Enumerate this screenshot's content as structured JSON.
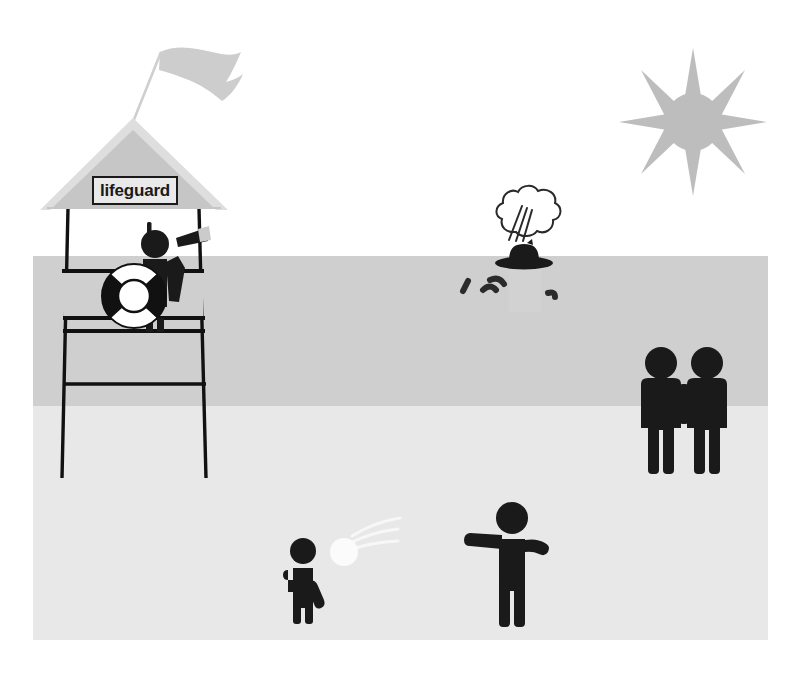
{
  "scene": {
    "title": "Beach lifeguard scene",
    "frame": {
      "x": 33,
      "y": 22,
      "width": 735,
      "height": 618
    }
  },
  "colors": {
    "sky": "#ffffff",
    "sea": "#cfcfcf",
    "sand": "#e8e8e8",
    "figure": "#1a1a1a",
    "sun": "#bdbdbd",
    "flag": "#cdcdcd",
    "roof": "#c6c6c6",
    "roof_edge": "#d8d8d8",
    "ball": "#fbfbfb",
    "block": "#d2d2d2",
    "outline": "#111111",
    "sign_fill": "#e9e9e9"
  },
  "bands": [
    {
      "name": "sky",
      "label": "sky",
      "y": 22,
      "height": 234,
      "color": "#ffffff"
    },
    {
      "name": "sea",
      "label": "sea",
      "y": 256,
      "height": 150,
      "color": "#cfcfcf"
    },
    {
      "name": "sand",
      "label": "sand",
      "y": 406,
      "height": 234,
      "color": "#e8e8e8"
    }
  ],
  "lifeguard_tower": {
    "name": "lifeguard-tower",
    "sign_label": "lifeguard",
    "sign": {
      "x": 93,
      "y": 177,
      "width": 82,
      "height": 26
    },
    "roof": {
      "apex_x": 133,
      "apex_y": 120,
      "left_x": 44,
      "right_x": 222,
      "base_y": 210
    },
    "legs": [
      {
        "name": "left-leg",
        "x": 67,
        "top": 206,
        "bottom": 478
      },
      {
        "name": "right-leg",
        "x": 200,
        "top": 206,
        "bottom": 478
      }
    ],
    "rails": [
      {
        "name": "deck-rail-top",
        "y": 270,
        "x1": 62,
        "x2": 205
      },
      {
        "name": "deck-rail-mid",
        "y": 318,
        "x1": 62,
        "x2": 205
      },
      {
        "name": "deck-rail-low",
        "y": 330,
        "x1": 62,
        "x2": 205
      },
      {
        "name": "deck-rail-bottom",
        "y": 383,
        "x1": 62,
        "x2": 205
      }
    ],
    "flag": {
      "pole_base_x": 133,
      "pole_base_y": 120,
      "pole_tip_x": 160,
      "pole_tip_y": 50
    },
    "life_ring": {
      "cx": 134,
      "cy": 295,
      "r_outer": 32,
      "r_inner": 16
    },
    "guard": {
      "name": "lifeguard-figure",
      "alert_mark": "!",
      "holding": "telescope",
      "head": {
        "cx": 152,
        "cy": 238,
        "r": 14
      }
    }
  },
  "sun": {
    "name": "sun",
    "cx": 693,
    "cy": 122,
    "core_r": 27,
    "ray_count": 8,
    "ray_length": 48,
    "color": "#bdbdbd"
  },
  "swimmer": {
    "name": "splashing-swimmer",
    "hat": true,
    "spray_label": "water spray",
    "block": {
      "x": 508,
      "y": 268,
      "width": 32,
      "height": 42
    },
    "hat_cx": 524,
    "hat_cy": 255,
    "waves": [
      {
        "x": 466,
        "y": 283
      },
      {
        "x": 486,
        "y": 288
      },
      {
        "x": 490,
        "y": 278
      },
      {
        "x": 549,
        "y": 291
      }
    ]
  },
  "couple": {
    "name": "couple-holding-hands",
    "count": 2,
    "figures": [
      {
        "name": "couple-figure-left",
        "cx": 660,
        "head_cy": 363,
        "head_r": 15
      },
      {
        "name": "couple-figure-right",
        "cx": 706,
        "head_cy": 363,
        "head_r": 15
      }
    ]
  },
  "ball_players": {
    "name": "ball-players",
    "catcher": {
      "name": "catcher-figure",
      "cx": 303,
      "head_cy": 551,
      "head_r": 13
    },
    "thrower": {
      "name": "thrower-figure",
      "cx": 511,
      "head_cy": 518,
      "head_r": 16
    },
    "ball": {
      "name": "beach-ball",
      "cx": 344,
      "cy": 551,
      "r": 14,
      "color": "#fbfbfb"
    },
    "trail_label": "motion trail"
  }
}
